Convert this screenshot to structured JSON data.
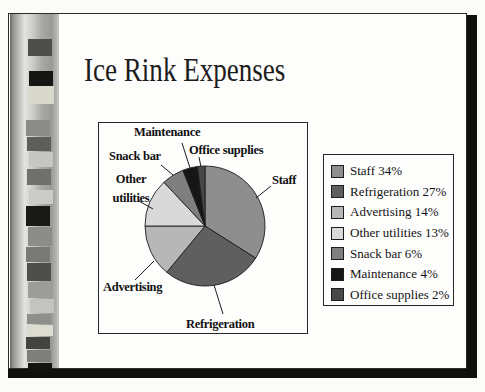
{
  "slide": {
    "title": "Ice Rink Expenses"
  },
  "chart_data": {
    "type": "pie",
    "title": "Ice Rink Expenses",
    "categories": [
      "Staff",
      "Refrigeration",
      "Advertising",
      "Other utilities",
      "Snack bar",
      "Maintenance",
      "Office supplies"
    ],
    "values": [
      34,
      27,
      14,
      13,
      6,
      4,
      2
    ],
    "unit": "percent",
    "colors": [
      "#8e8e8e",
      "#5f5f5f",
      "#b7b7b7",
      "#d9d9d9",
      "#7f7f7f",
      "#161616",
      "#484848"
    ],
    "start_angle": "12-oclock",
    "direction": "clockwise",
    "legend_position": "right",
    "legend_entries": [
      "Staff 34%",
      "Refrigeration 27%",
      "Advertising 14%",
      "Other utilities 13%",
      "Snack bar 6%",
      "Maintenance 4%",
      "Office supplies 2%"
    ],
    "slice_labels": {
      "staff": "Staff",
      "refrigeration": "Refrigeration",
      "advertising": "Advertising",
      "other_utilities": "Other utilities",
      "snack_bar": "Snack bar",
      "maintenance": "Maintenance",
      "office_supplies": "Office supplies"
    },
    "outline_color": "#1c1c1c"
  },
  "decor": {
    "film_strip_squares": [
      {
        "top": 25,
        "h": 17,
        "dx": 2,
        "color": "#4e4e4a"
      },
      {
        "top": 57,
        "h": 15,
        "dx": 3,
        "color": "#151513"
      },
      {
        "top": 72,
        "h": 18,
        "dx": 4,
        "color": "#d8d8cc"
      },
      {
        "top": 106,
        "h": 16,
        "dx": 0,
        "color": "#8b8b87"
      },
      {
        "top": 123,
        "h": 14,
        "dx": 1,
        "color": "#5d5d5b"
      },
      {
        "top": 138,
        "h": 15,
        "dx": 3,
        "color": "#c6c6c2"
      },
      {
        "top": 155,
        "h": 16,
        "dx": 1,
        "color": "#6f6f6b"
      },
      {
        "top": 176,
        "h": 14,
        "dx": 3,
        "color": "#cbcbc7"
      },
      {
        "top": 192,
        "h": 20,
        "dx": 0,
        "color": "#191917"
      },
      {
        "top": 213,
        "h": 19,
        "dx": 2,
        "color": "#8c8c88"
      },
      {
        "top": 233,
        "h": 15,
        "dx": 0,
        "color": "#797975"
      },
      {
        "top": 249,
        "h": 18,
        "dx": 1,
        "color": "#4e4e4c"
      },
      {
        "top": 268,
        "h": 16,
        "dx": 2,
        "color": "#9c9c98"
      },
      {
        "top": 285,
        "h": 14,
        "dx": 4,
        "color": "#c3c3bf"
      },
      {
        "top": 300,
        "h": 10,
        "dx": 1,
        "color": "#8e8e8a"
      },
      {
        "top": 311,
        "h": 11,
        "dx": 3,
        "color": "#dcdcd0"
      },
      {
        "top": 323,
        "h": 12,
        "dx": 0,
        "color": "#434341"
      },
      {
        "top": 336,
        "h": 12,
        "dx": 1,
        "color": "#7e7e7a"
      },
      {
        "top": 349,
        "h": 9,
        "dx": 2,
        "color": "#131311"
      }
    ]
  }
}
